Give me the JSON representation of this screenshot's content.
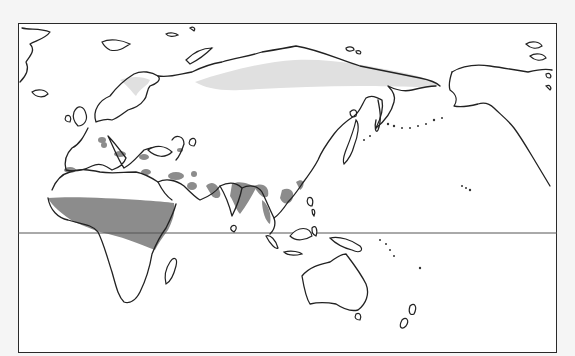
{
  "map": {
    "projection": "world, Eurasia/Pacific centered",
    "frame": {
      "left": 18,
      "top": 23,
      "width": 539,
      "height": 330
    },
    "equator_y": 233,
    "colors": {
      "background": "#f5f5f5",
      "map_fill": "#ffffff",
      "coastline": "#222222",
      "range_dark": "#8c8c8c",
      "range_light": "#e0e0e0"
    },
    "legend": [],
    "regions": [
      {
        "name": "Sahel / sub-Saharan band",
        "shade": "dark"
      },
      {
        "name": "Mediterranean & Middle East patches",
        "shade": "dark"
      },
      {
        "name": "South & Southeast Asia",
        "shade": "dark"
      },
      {
        "name": "East China coast",
        "shade": "dark"
      },
      {
        "name": "Northern Siberia / Scandinavia",
        "shade": "light"
      }
    ]
  }
}
